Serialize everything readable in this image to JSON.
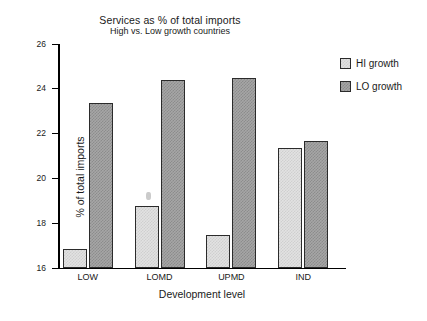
{
  "chart_data": {
    "type": "bar",
    "title": "Services as % of total imports",
    "subtitle": "High vs. Low growth countries",
    "xlabel": "Development level",
    "ylabel": "% of total imports",
    "categories": [
      "LOW",
      "LOMD",
      "UPMD",
      "IND"
    ],
    "series": [
      {
        "name": "HI growth",
        "values": [
          16.85,
          18.77,
          17.48,
          21.35
        ],
        "color": "#e2e2e2"
      },
      {
        "name": "LO growth",
        "values": [
          23.35,
          24.4,
          24.5,
          21.68
        ],
        "color": "#a6a6a6"
      }
    ],
    "ylim": [
      16,
      26
    ],
    "yticks": [
      16,
      18,
      20,
      22,
      24,
      26
    ],
    "ytick_labels": [
      "16",
      "18",
      "20",
      "22",
      "24",
      "26"
    ],
    "grid": false,
    "legend_position": "right"
  },
  "legend": {
    "items": [
      {
        "label": "HI growth"
      },
      {
        "label": "LO growth"
      }
    ]
  },
  "colors": {
    "axis": "#000000",
    "text": "#1a1a1a",
    "bar_hi": "#e2e2e2",
    "bar_lo": "#a6a6a6",
    "bar_outline": "#2b2b2b",
    "background": "#ffffff"
  }
}
